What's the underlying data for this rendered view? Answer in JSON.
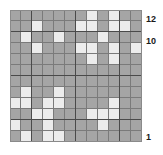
{
  "figure": {
    "kind": "binary-grid-heatmap",
    "rows": 12,
    "cols": 12,
    "block_size": 4,
    "colors": {
      "filled": "#a5a5a5",
      "empty": "#ececec",
      "gridline": "#7a7a7a",
      "block_line": "#4a4a4a",
      "label_text": "#1a1a1a",
      "background": "#ffffff"
    }
  },
  "axis_labels": {
    "top": "12",
    "second": "10",
    "bottom": "1"
  },
  "chart_data": {
    "type": "heatmap",
    "title": "",
    "xlabel": "",
    "ylabel": "",
    "rows": 12,
    "cols": 12,
    "row_labels": [
      "12",
      "11",
      "10",
      "9",
      "8",
      "7",
      "6",
      "5",
      "4",
      "3",
      "2",
      "1"
    ],
    "col_labels": [
      "1",
      "2",
      "3",
      "4",
      "5",
      "6",
      "7",
      "8",
      "9",
      "10",
      "11",
      "12"
    ],
    "visible_tick_labels": [
      "12",
      "10",
      "1"
    ],
    "legend": [],
    "grid": true,
    "value_map": {
      "0": "filled-gray",
      "1": "empty-white"
    },
    "values": [
      [
        0,
        0,
        0,
        0,
        0,
        0,
        0,
        1,
        0,
        1,
        0,
        0
      ],
      [
        0,
        0,
        1,
        0,
        0,
        0,
        1,
        1,
        0,
        1,
        1,
        0
      ],
      [
        0,
        1,
        0,
        0,
        1,
        0,
        0,
        0,
        1,
        0,
        0,
        0
      ],
      [
        0,
        0,
        1,
        0,
        0,
        0,
        1,
        1,
        0,
        1,
        0,
        1
      ],
      [
        0,
        0,
        0,
        0,
        0,
        0,
        0,
        1,
        0,
        1,
        0,
        0
      ],
      [
        0,
        0,
        0,
        0,
        0,
        0,
        0,
        0,
        0,
        0,
        0,
        0
      ],
      [
        0,
        0,
        0,
        0,
        0,
        0,
        0,
        0,
        0,
        0,
        0,
        0
      ],
      [
        0,
        1,
        0,
        0,
        1,
        0,
        0,
        0,
        0,
        0,
        0,
        0
      ],
      [
        1,
        1,
        0,
        1,
        1,
        0,
        0,
        0,
        0,
        1,
        0,
        0
      ],
      [
        0,
        0,
        1,
        1,
        0,
        0,
        0,
        1,
        1,
        1,
        0,
        0
      ],
      [
        1,
        0,
        0,
        1,
        0,
        0,
        0,
        0,
        1,
        0,
        0,
        0
      ],
      [
        0,
        1,
        0,
        1,
        1,
        0,
        0,
        0,
        0,
        0,
        0,
        0
      ]
    ]
  }
}
